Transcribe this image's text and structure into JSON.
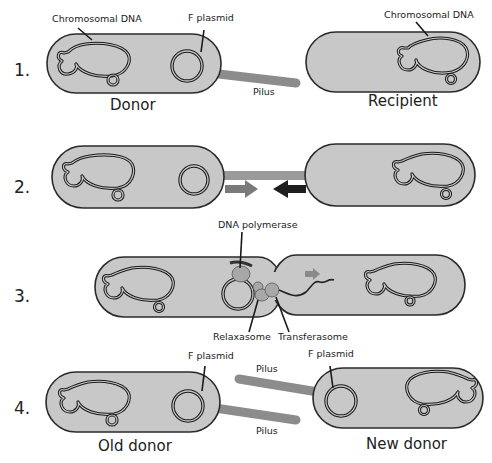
{
  "diagram": {
    "steps": [
      {
        "number": "1.",
        "labels": {
          "chromosomal_dna_left": "Chromosomal DNA",
          "f_plasmid": "F plasmid",
          "pilus": "Pilus",
          "chromosomal_dna_right": "Chromosomal DNA",
          "donor": "Donor",
          "recipient": "Recipient"
        }
      },
      {
        "number": "2.",
        "labels": {}
      },
      {
        "number": "3.",
        "labels": {
          "dna_polymerase": "DNA polymerase",
          "relaxasome": "Relaxasome",
          "transferasome": "Transferasome"
        }
      },
      {
        "number": "4.",
        "labels": {
          "f_plasmid_left": "F plasmid",
          "f_plasmid_right": "F plasmid",
          "pilus_top": "Pilus",
          "pilus_bottom": "Pilus",
          "old_donor": "Old donor",
          "new_donor": "New donor"
        }
      }
    ],
    "colors": {
      "cell_fill": "#c8c8c8",
      "outline": "#1a1a1a",
      "pilus": "#8c8c8c",
      "arrow_light": "#7a7a7a",
      "arrow_dark": "#1e1e1e"
    }
  }
}
